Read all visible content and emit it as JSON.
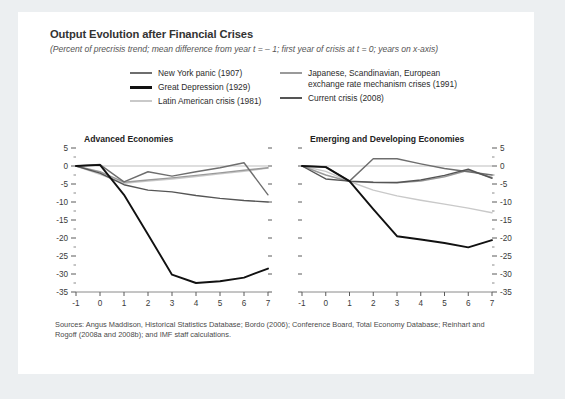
{
  "figure": {
    "title": "Output Evolution after Financial Crises",
    "subtitle": "(Percent of precrisis trend; mean difference from year t = – 1; first year of crisis at t = 0; years on x-axis)",
    "sources": "Sources: Angus Maddison, Historical Statistics Database; Bordo (2006); Conference Board, Total Economy Database; Reinhart and Rogoff (2008a and 2008b); and IMF staff calculations."
  },
  "legend": {
    "position": "top-center",
    "columns": [
      {
        "items": [
          {
            "label": "New York panic (1907)",
            "color": "#6e6e6e"
          },
          {
            "label": "Great Depression (1929)",
            "color": "#111111"
          },
          {
            "label": "Latin American crisis (1981)",
            "color": "#c9c9c9"
          }
        ]
      },
      {
        "items": [
          {
            "label": "Japanese, Scandinavian, European\nexchange rate mechanism crises (1991)",
            "color": "#9a9a9a"
          },
          {
            "label": "Current crisis (2008)",
            "color": "#555555"
          }
        ]
      }
    ]
  },
  "chart_data": [
    {
      "type": "line",
      "title": "Advanced Economies",
      "xlabel": "",
      "ylabel": "",
      "x": [
        -1,
        0,
        1,
        2,
        3,
        4,
        5,
        6,
        7
      ],
      "xlim": [
        -1,
        7
      ],
      "ylim": [
        -35,
        5
      ],
      "ytick_labels": [
        "5",
        "0",
        "-5",
        "-10",
        "-15",
        "-20",
        "-25",
        "-30",
        "-35"
      ],
      "ytick_values": [
        5,
        0,
        -5,
        -10,
        -15,
        -20,
        -25,
        -30,
        -35
      ],
      "xtick_labels": [
        "-1",
        "0",
        "1",
        "2",
        "3",
        "4",
        "5",
        "6",
        "7"
      ],
      "grid": false,
      "zero_line": true,
      "y_axis_side": "left",
      "series": [
        {
          "name": "New York panic (1907)",
          "color": "#6e6e6e",
          "values": [
            0,
            0.4,
            -4.4,
            -1.6,
            -2.8,
            -1.6,
            -0.5,
            0.9,
            -8.0
          ]
        },
        {
          "name": "Great Depression (1929)",
          "color": "#111111",
          "values": [
            0,
            0.3,
            -8.0,
            -19.0,
            -30.2,
            -32.5,
            -32.0,
            -31.0,
            -28.5
          ]
        },
        {
          "name": "Latin American crisis (1981)",
          "color": "#c9c9c9",
          "values": [
            0,
            -2.3,
            -4.8,
            -4.2,
            -3.6,
            -2.9,
            -2.2,
            -1.5,
            -0.6
          ]
        },
        {
          "name": "Japanese, Scandinavian, European exchange rate mechanism crises (1991)",
          "color": "#9a9a9a",
          "values": [
            0,
            -1.6,
            -4.5,
            -3.9,
            -3.3,
            -2.6,
            -1.9,
            -1.2,
            -0.5
          ]
        },
        {
          "name": "Current crisis (2008)",
          "color": "#555555",
          "values": [
            0,
            -2.0,
            -5.2,
            -6.7,
            -7.2,
            -8.2,
            -9.0,
            -9.6,
            -10.0
          ]
        }
      ]
    },
    {
      "type": "line",
      "title": "Emerging and Developing Economies",
      "xlabel": "",
      "ylabel": "",
      "x": [
        -1,
        0,
        1,
        2,
        3,
        4,
        5,
        6,
        7
      ],
      "xlim": [
        -1,
        7
      ],
      "ylim": [
        -35,
        5
      ],
      "ytick_labels": [
        "5",
        "0",
        "-5",
        "-10",
        "-15",
        "-20",
        "-25",
        "-30",
        "-35"
      ],
      "ytick_values": [
        5,
        0,
        -5,
        -10,
        -15,
        -20,
        -25,
        -30,
        -35
      ],
      "xtick_labels": [
        "-1",
        "0",
        "1",
        "2",
        "3",
        "4",
        "5",
        "6",
        "7"
      ],
      "grid": false,
      "zero_line": true,
      "y_axis_side": "right",
      "series": [
        {
          "name": "New York panic (1907)",
          "color": "#6e6e6e",
          "values": [
            0,
            -0.2,
            -4.2,
            2.0,
            2.0,
            0.6,
            -0.7,
            -1.6,
            -2.5
          ]
        },
        {
          "name": "Great Depression (1929)",
          "color": "#111111",
          "values": [
            0,
            -0.3,
            -4.2,
            -12.0,
            -19.5,
            -20.4,
            -21.4,
            -22.6,
            -20.6
          ]
        },
        {
          "name": "Latin American crisis (1981)",
          "color": "#c9c9c9",
          "values": [
            0,
            -1.5,
            -4.3,
            -6.7,
            -8.3,
            -9.5,
            -10.6,
            -11.7,
            -13.0
          ]
        },
        {
          "name": "Japanese, Scandinavian, European exchange rate mechanism crises (1991)",
          "color": "#9a9a9a",
          "values": [
            0,
            -2.5,
            -4.3,
            -4.6,
            -4.7,
            -4.2,
            -3.0,
            -1.2,
            -3.2
          ]
        },
        {
          "name": "Current crisis (2008)",
          "color": "#555555",
          "values": [
            0,
            -3.6,
            -4.2,
            -4.5,
            -4.6,
            -3.9,
            -2.6,
            -0.9,
            -3.4
          ]
        }
      ]
    }
  ]
}
